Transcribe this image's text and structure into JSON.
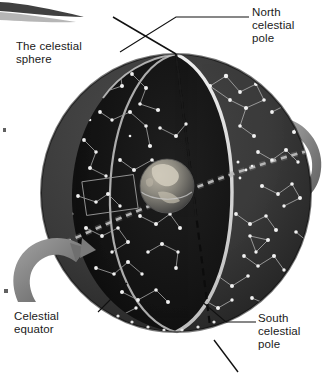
{
  "figure": {
    "background_color": "#ffffff"
  },
  "labels": {
    "celestial_sphere": "The celestial\nsphere",
    "north_celestial_pole": "North\ncelestial\npole",
    "celestial_equator": "Celestial\nequator",
    "south_celestial_pole": "South\ncelestial\npole"
  },
  "colors": {
    "text": "#1a1a1a",
    "leader_line": "#111111",
    "sphere_outer": "#3a3a3a",
    "sphere_inner": "#141414",
    "cut_edge": "#d8d8d8",
    "star": "#f2f2f2",
    "constellation_line": "#9a9a9a",
    "equator_dash": "#b9b9b9",
    "axis_line": "#0d0d0d",
    "rotation_arrow": "#8a8a8a",
    "earth_land": "#c9c4b8",
    "earth_ocean": "#5d5d5d",
    "page": "#ffffff",
    "scan_artifact": "#2b2b2b"
  },
  "geometry": {
    "sphere_center_x": 176,
    "sphere_center_y": 193,
    "sphere_radius_x": 135,
    "sphere_radius_y": 139,
    "earth_center_x": 167,
    "earth_center_y": 186,
    "earth_radius": 27,
    "axis_tilt_degrees": 23
  },
  "annotations": {
    "axis_name": "rotation-axis",
    "equator_name": "celestial-equator-dashed-band",
    "arrow_left_name": "rotation-arrow-left",
    "arrow_right_name": "rotation-arrow-right"
  }
}
